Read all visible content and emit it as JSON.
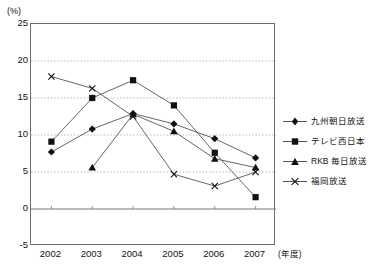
{
  "chart_data": {
    "type": "line",
    "title": "",
    "xlabel": "(年度)",
    "ylabel": "(%)",
    "x": [
      "2002",
      "2003",
      "2004",
      "2005",
      "2006",
      "2007"
    ],
    "categories": [
      "2002",
      "2003",
      "2004",
      "2005",
      "2006",
      "2007"
    ],
    "ylim": [
      -5,
      25
    ],
    "yticks": [
      "25",
      "20",
      "15",
      "10",
      "5",
      "0",
      "-5"
    ],
    "ytick_values": [
      25,
      20,
      15,
      10,
      5,
      0,
      -5
    ],
    "grid": "horizontal dotted gridlines at every 5 units; solid zero line",
    "legend_position": "right",
    "series": [
      {
        "name": "九州朝日放送",
        "marker": "diamond",
        "values": [
          7.7,
          10.8,
          12.9,
          11.5,
          9.5,
          6.9
        ]
      },
      {
        "name": "テレビ西日本",
        "marker": "square",
        "values": [
          9.1,
          15.0,
          17.4,
          14.0,
          7.6,
          1.6
        ]
      },
      {
        "name": "RKB 毎日放送",
        "marker": "triangle",
        "values": [
          null,
          5.6,
          12.8,
          10.5,
          6.8,
          5.6
        ]
      },
      {
        "name": "福岡放送",
        "marker": "cross",
        "values": [
          17.9,
          16.3,
          12.5,
          4.7,
          3.1,
          5.0
        ]
      }
    ]
  },
  "axis": {
    "y_unit_label": "(%)",
    "x_unit_label": "(年度)"
  },
  "legend": {
    "items": [
      {
        "label": "九州朝日放送",
        "marker": "diamond"
      },
      {
        "label": "テレビ西日本",
        "marker": "square"
      },
      {
        "label": "RKB 毎日放送",
        "marker": "triangle"
      },
      {
        "label": "福岡放送",
        "marker": "cross"
      }
    ]
  },
  "caption": {
    "text": ""
  },
  "colors": {
    "line": "#555555",
    "marker": "#111111",
    "grid": "#aaaaaa",
    "axis": "#6e6e6e",
    "background": "#ffffff"
  }
}
